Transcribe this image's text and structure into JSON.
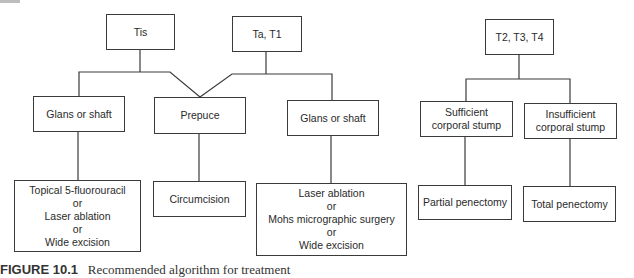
{
  "diagram": {
    "type": "flowchart",
    "stages": {
      "tis": "Tis",
      "ta_t1": "Ta, T1",
      "t2_t4": "T2, T3, T4"
    },
    "sites": {
      "glans_left": "Glans or shaft",
      "prepuce": "Prepuce",
      "glans_right": "Glans or shaft",
      "sufficient": [
        "Sufficient",
        "corporal stump"
      ],
      "insufficient": [
        "Insufficient",
        "corporal stump"
      ]
    },
    "treatments": {
      "tis_glans": [
        "Topical 5-fluorouracil",
        "or",
        "Laser ablation",
        "or",
        "Wide excision"
      ],
      "prepuce": "Circumcision",
      "t1_glans": [
        "Laser ablation",
        "or",
        "Mohs micrographic surgery",
        "or",
        "Wide excision"
      ],
      "partial": "Partial penectomy",
      "total": "Total penectomy"
    },
    "edges": [
      [
        "Tis",
        "Glans or shaft (left)"
      ],
      [
        "Tis",
        "Prepuce"
      ],
      [
        "Ta, T1",
        "Prepuce"
      ],
      [
        "Ta, T1",
        "Glans or shaft (right)"
      ],
      [
        "Glans or shaft (left)",
        "Topical 5-fluorouracil or Laser ablation or Wide excision"
      ],
      [
        "Prepuce",
        "Circumcision"
      ],
      [
        "Glans or shaft (right)",
        "Laser ablation or Mohs micrographic surgery or Wide excision"
      ],
      [
        "T2, T3, T4",
        "Sufficient corporal stump"
      ],
      [
        "T2, T3, T4",
        "Insufficient corporal stump"
      ],
      [
        "Sufficient corporal stump",
        "Partial penectomy"
      ],
      [
        "Insufficient corporal stump",
        "Total penectomy"
      ]
    ]
  },
  "caption": {
    "label": "FIGURE 10.1",
    "text": "Recommended algorithm for treatment"
  }
}
